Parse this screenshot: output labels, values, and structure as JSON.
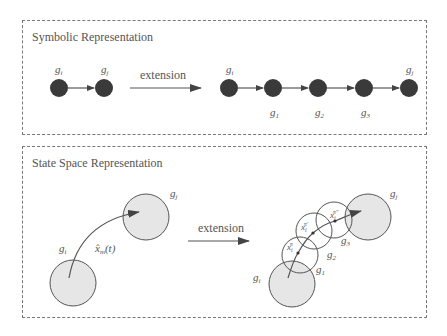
{
  "symbolic": {
    "title": "Symbolic Representation",
    "extension_label": "extension",
    "left_nodes": [
      {
        "base": "g",
        "sub": "i"
      },
      {
        "base": "g",
        "sub": "j"
      }
    ],
    "right_nodes": [
      {
        "base": "g",
        "sub": "i"
      },
      {
        "base": "g",
        "sub": "1"
      },
      {
        "base": "g",
        "sub": "2"
      },
      {
        "base": "g",
        "sub": "3"
      },
      {
        "base": "g",
        "sub": "j"
      }
    ]
  },
  "state_space": {
    "title": "State Space Representation",
    "extension_label": "extension",
    "left": {
      "start_region": {
        "base": "g",
        "sub": "i"
      },
      "goal_region": {
        "base": "g",
        "sub": "j"
      },
      "trajectory": {
        "base": "x̂",
        "sub": "m",
        "arg": "(t)"
      }
    },
    "right": {
      "regions": [
        {
          "base": "g",
          "sub": "i"
        },
        {
          "base": "g",
          "sub": "1"
        },
        {
          "base": "g",
          "sub": "2"
        },
        {
          "base": "g",
          "sub": "3"
        },
        {
          "base": "g",
          "sub": "j"
        }
      ],
      "points": [
        {
          "base": "x",
          "sub": "i",
          "sup": "π"
        },
        {
          "base": "x",
          "sub": "i",
          "sup": "π′"
        },
        {
          "base": "x",
          "sub": "i",
          "sup": "π″"
        }
      ]
    }
  },
  "colors": {
    "node_fill": "#3a3a3a",
    "region_fill": "#e6e6e6",
    "stroke": "#555555",
    "border": "#777777"
  }
}
